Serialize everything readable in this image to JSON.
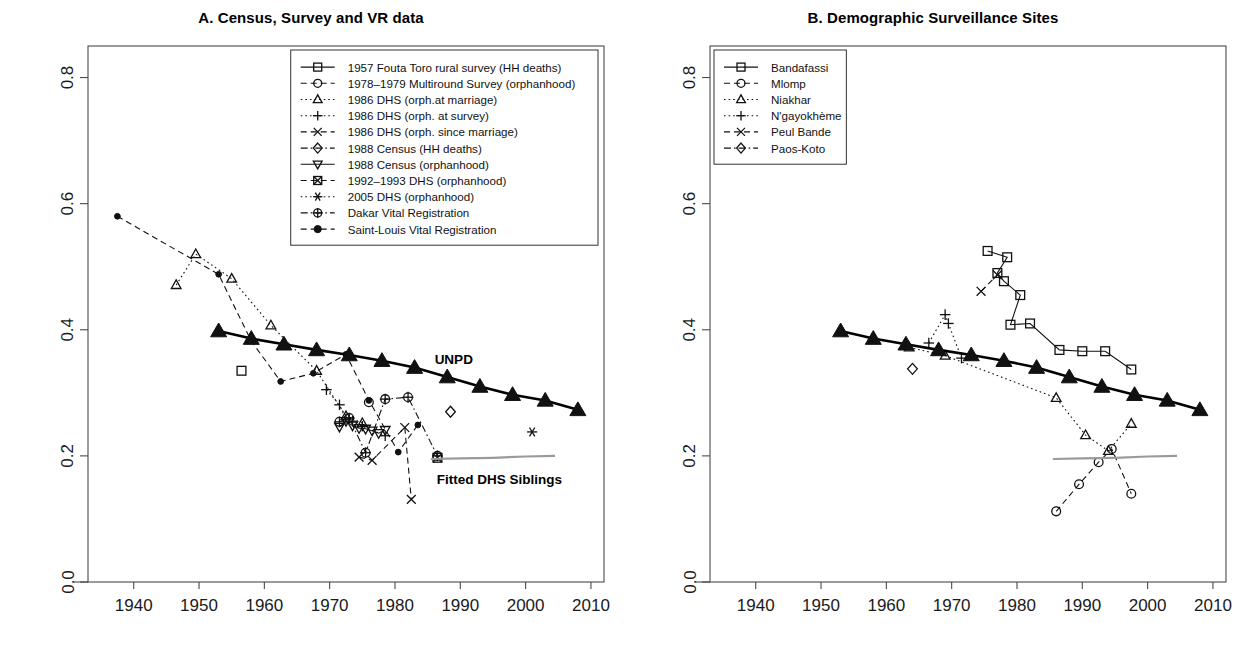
{
  "figure": {
    "width": 1244,
    "height": 657,
    "annotations": {
      "unpd_label": "UNPD",
      "fitted_label": "Fitted DHS Siblings"
    }
  },
  "chart_data": [
    {
      "type": "scatter",
      "panel": "A",
      "title": "A. Census, Survey and VR data",
      "xlabel": "",
      "ylabel": "",
      "xlim": [
        1933,
        2012
      ],
      "ylim": [
        0.0,
        0.85
      ],
      "xticks": [
        1940,
        1950,
        1960,
        1970,
        1980,
        1990,
        2000,
        2010
      ],
      "yticks": [
        0.0,
        0.2,
        0.4,
        0.6,
        0.8
      ],
      "ytick_labels": [
        "0.0",
        "0.2",
        "0.4",
        "0.6",
        "0.8"
      ],
      "grid": false,
      "legend_position": "top-right-inside",
      "series": [
        {
          "name": "1957 Fouta Toro rural survey (HH deaths)",
          "marker": "square",
          "line": "solid",
          "points": [
            [
              1956.5,
              0.335
            ]
          ]
        },
        {
          "name": "1978-1979 Multiround Survey (orphanhood)",
          "marker": "circle",
          "line": "dashed",
          "points": [
            [
              1976.0,
              0.285
            ]
          ]
        },
        {
          "name": "1986 DHS (orph.at marriage)",
          "marker": "triangle-up",
          "line": "dotted",
          "points": [
            [
              1946.5,
              0.471
            ],
            [
              1949.5,
              0.52
            ],
            [
              1955.0,
              0.481
            ],
            [
              1961.0,
              0.407
            ],
            [
              1968.0,
              0.335
            ],
            [
              1972.5,
              0.263
            ],
            [
              1975.0,
              0.252
            ]
          ]
        },
        {
          "name": "1986 DHS (orph. at survey)",
          "marker": "plus",
          "line": "dotted",
          "points": [
            [
              1969.5,
              0.305
            ],
            [
              1971.5,
              0.281
            ],
            [
              1972.5,
              0.258
            ],
            [
              1973.5,
              0.255
            ],
            [
              1975.0,
              0.247
            ],
            [
              1978.5,
              0.232
            ]
          ]
        },
        {
          "name": "1986 DHS (orph. since marriage)",
          "marker": "x",
          "line": "dashed",
          "points": [
            [
              1974.5,
              0.198
            ],
            [
              1976.5,
              0.193
            ],
            [
              1981.5,
              0.245
            ],
            [
              1982.5,
              0.131
            ]
          ]
        },
        {
          "name": "1988 Census (HH deaths)",
          "marker": "diamond",
          "line": "dash-dot",
          "points": [
            [
              1988.5,
              0.27
            ]
          ]
        },
        {
          "name": "1988 Census (orphanhood)",
          "marker": "triangle-down",
          "line": "solid",
          "points": [
            [
              1971.5,
              0.246
            ],
            [
              1972.5,
              0.255
            ],
            [
              1973.5,
              0.248
            ],
            [
              1974.5,
              0.244
            ],
            [
              1975.5,
              0.243
            ],
            [
              1976.5,
              0.24
            ],
            [
              1977.5,
              0.236
            ],
            [
              1978.5,
              0.241
            ]
          ]
        },
        {
          "name": "1992-1993 DHS (orphanhood)",
          "marker": "square-crossed",
          "line": "dashed",
          "points": [
            [
              1986.5,
              0.197
            ]
          ]
        },
        {
          "name": "2005 DHS (orphanhood)",
          "marker": "asterisk",
          "line": "dotted",
          "points": [
            [
              2001.0,
              0.238
            ]
          ]
        },
        {
          "name": "Dakar Vital Registration",
          "marker": "circle-plus",
          "line": "dash-dot",
          "points": [
            [
              1971.5,
              0.254
            ],
            [
              1973.0,
              0.26
            ],
            [
              1975.5,
              0.205
            ],
            [
              1978.5,
              0.29
            ],
            [
              1982.0,
              0.293
            ],
            [
              1986.5,
              0.2
            ]
          ]
        },
        {
          "name": "Saint-Louis Vital Registration",
          "marker": "circle-filled",
          "line": "dashed",
          "points": [
            [
              1937.5,
              0.58
            ],
            [
              1953.0,
              0.488
            ],
            [
              1958.0,
              0.382
            ],
            [
              1962.5,
              0.318
            ],
            [
              1967.5,
              0.331
            ],
            [
              1972.5,
              0.361
            ],
            [
              1976.0,
              0.288
            ],
            [
              1980.5,
              0.206
            ],
            [
              1983.5,
              0.249
            ]
          ]
        },
        {
          "name": "UNPD",
          "marker": "triangle-filled",
          "line": "solid-thick",
          "points": [
            [
              1953,
              0.398
            ],
            [
              1958,
              0.386
            ],
            [
              1963,
              0.377
            ],
            [
              1968,
              0.368
            ],
            [
              1973,
              0.36
            ],
            [
              1978,
              0.351
            ],
            [
              1983,
              0.34
            ],
            [
              1988,
              0.325
            ],
            [
              1993,
              0.31
            ],
            [
              1998,
              0.297
            ],
            [
              2003,
              0.288
            ],
            [
              2008,
              0.273
            ]
          ]
        },
        {
          "name": "Fitted DHS Siblings",
          "marker": "none",
          "line": "gray-solid",
          "points": [
            [
              1985.5,
              0.195
            ],
            [
              1990.0,
              0.196
            ],
            [
              1995.0,
              0.197
            ],
            [
              2000.0,
              0.199
            ],
            [
              2004.5,
              0.2
            ]
          ]
        }
      ]
    },
    {
      "type": "scatter",
      "panel": "B",
      "title": "B. Demographic Surveillance Sites",
      "xlabel": "",
      "ylabel": "",
      "xlim": [
        1933,
        2012
      ],
      "ylim": [
        0.0,
        0.85
      ],
      "xticks": [
        1940,
        1950,
        1960,
        1970,
        1980,
        1990,
        2000,
        2010
      ],
      "yticks": [
        0.0,
        0.2,
        0.4,
        0.6,
        0.8
      ],
      "ytick_labels": [
        "0.0",
        "0.2",
        "0.4",
        "0.6",
        "0.8"
      ],
      "grid": false,
      "legend_position": "top-left-inside",
      "series": [
        {
          "name": "Bandafassi",
          "marker": "square",
          "line": "solid",
          "points": [
            [
              1975.5,
              0.525
            ],
            [
              1978.5,
              0.515
            ],
            [
              1977.0,
              0.49
            ],
            [
              1978.0,
              0.477
            ],
            [
              1980.5,
              0.455
            ],
            [
              1979.0,
              0.408
            ],
            [
              1982.0,
              0.41
            ],
            [
              1986.5,
              0.368
            ],
            [
              1990.0,
              0.366
            ],
            [
              1993.5,
              0.366
            ],
            [
              1997.5,
              0.337
            ]
          ]
        },
        {
          "name": "Mlomp",
          "marker": "circle",
          "line": "dashed",
          "points": [
            [
              1986.0,
              0.112
            ],
            [
              1989.5,
              0.155
            ],
            [
              1992.5,
              0.19
            ],
            [
              1994.5,
              0.211
            ],
            [
              1997.5,
              0.14
            ]
          ]
        },
        {
          "name": "Niakhar",
          "marker": "triangle-up",
          "line": "dotted",
          "points": [
            [
              1963.5,
              0.372
            ],
            [
              1969.0,
              0.359
            ],
            [
              1986.0,
              0.292
            ],
            [
              1990.5,
              0.233
            ],
            [
              1994.0,
              0.208
            ],
            [
              1997.5,
              0.251
            ]
          ]
        },
        {
          "name": "N'gayokhème",
          "marker": "plus",
          "line": "dotted",
          "points": [
            [
              1966.5,
              0.379
            ],
            [
              1969.0,
              0.424
            ],
            [
              1969.5,
              0.41
            ],
            [
              1971.5,
              0.355
            ]
          ]
        },
        {
          "name": "Peul Bande",
          "marker": "x",
          "line": "dashed",
          "points": [
            [
              1974.5,
              0.461
            ],
            [
              1977.0,
              0.487
            ]
          ]
        },
        {
          "name": "Paos-Koto",
          "marker": "diamond",
          "line": "dash-dot",
          "points": [
            [
              1964.0,
              0.338
            ]
          ]
        },
        {
          "name": "UNPD",
          "marker": "triangle-filled",
          "line": "solid-thick",
          "points": [
            [
              1953,
              0.398
            ],
            [
              1958,
              0.386
            ],
            [
              1963,
              0.377
            ],
            [
              1968,
              0.368
            ],
            [
              1973,
              0.36
            ],
            [
              1978,
              0.351
            ],
            [
              1983,
              0.34
            ],
            [
              1988,
              0.325
            ],
            [
              1993,
              0.31
            ],
            [
              1998,
              0.297
            ],
            [
              2003,
              0.288
            ],
            [
              2008,
              0.273
            ]
          ]
        },
        {
          "name": "Fitted DHS Siblings",
          "marker": "none",
          "line": "gray-solid",
          "points": [
            [
              1985.5,
              0.195
            ],
            [
              1990.0,
              0.196
            ],
            [
              1995.0,
              0.197
            ],
            [
              2000.0,
              0.199
            ],
            [
              2004.5,
              0.2
            ]
          ]
        }
      ]
    }
  ],
  "panel_a": {
    "title": "A. Census, Survey and VR data",
    "legend": [
      {
        "label": "1957 Fouta Toro rural survey (HH deaths)",
        "marker": "square",
        "line": "solid"
      },
      {
        "label": "1978–1979 Multiround Survey (orphanhood)",
        "marker": "circle",
        "line": "dashed"
      },
      {
        "label": "1986 DHS (orph.at marriage)",
        "marker": "triangle-up",
        "line": "dotted"
      },
      {
        "label": "1986 DHS (orph. at survey)",
        "marker": "plus",
        "line": "dotted"
      },
      {
        "label": "1986 DHS (orph. since marriage)",
        "marker": "x",
        "line": "dashed"
      },
      {
        "label": "1988 Census (HH deaths)",
        "marker": "diamond",
        "line": "dash-dot"
      },
      {
        "label": "1988 Census (orphanhood)",
        "marker": "triangle-down",
        "line": "solid"
      },
      {
        "label": "1992–1993 DHS (orphanhood)",
        "marker": "square-crossed",
        "line": "dashed"
      },
      {
        "label": "2005 DHS (orphanhood)",
        "marker": "asterisk",
        "line": "dotted"
      },
      {
        "label": "Dakar Vital Registration",
        "marker": "circle-plus",
        "line": "dash-dot"
      },
      {
        "label": "Saint-Louis Vital Registration",
        "marker": "circle-filled",
        "line": "dashed"
      }
    ],
    "xticks": [
      "1940",
      "1950",
      "1960",
      "1970",
      "1980",
      "1990",
      "2000",
      "2010"
    ],
    "yticks": [
      "0.0",
      "0.2",
      "0.4",
      "0.6",
      "0.8"
    ],
    "unpd_label": "UNPD",
    "fitted_label": "Fitted DHS Siblings"
  },
  "panel_b": {
    "title": "B. Demographic Surveillance Sites",
    "legend": [
      {
        "label": "Bandafassi",
        "marker": "square",
        "line": "solid"
      },
      {
        "label": "Mlomp",
        "marker": "circle",
        "line": "dashed"
      },
      {
        "label": "Niakhar",
        "marker": "triangle-up",
        "line": "dotted"
      },
      {
        "label": "N'gayokhème",
        "marker": "plus",
        "line": "dotted"
      },
      {
        "label": "Peul Bande",
        "marker": "x",
        "line": "dashed"
      },
      {
        "label": "Paos-Koto",
        "marker": "diamond",
        "line": "dash-dot"
      }
    ],
    "xticks": [
      "1940",
      "1950",
      "1960",
      "1970",
      "1980",
      "1990",
      "2000",
      "2010"
    ],
    "yticks": [
      "0.0",
      "0.2",
      "0.4",
      "0.6",
      "0.8"
    ]
  }
}
